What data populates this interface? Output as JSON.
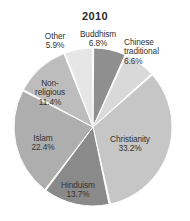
{
  "chart_data": {
    "type": "pie",
    "title": "2010",
    "xlabel": "",
    "ylabel": "",
    "legend_position": "none",
    "grid": false,
    "units": "percent",
    "categories": [
      "Buddhism",
      "Chinese traditional",
      "Christianity",
      "Hinduism",
      "Islam",
      "Non-religious",
      "Other"
    ],
    "values": [
      6.8,
      6.6,
      33.2,
      13.7,
      22.4,
      11.4,
      5.9
    ],
    "slices": [
      {
        "name": "Buddhism",
        "label": "Buddhism",
        "value": 6.8,
        "value_text": "6.8%",
        "color": "#8f8f8f",
        "start_angle": 0,
        "end_angle": 24.48
      },
      {
        "name": "Chinese traditional",
        "label": "Chinese\ntraditional",
        "value": 6.6,
        "value_text": "6.6%",
        "color": "#d9d9d9",
        "start_angle": 24.48,
        "end_angle": 48.24
      },
      {
        "name": "Christianity",
        "label": "Christianity",
        "value": 33.2,
        "value_text": "33.2%",
        "color": "#c6c6c6",
        "start_angle": 48.24,
        "end_angle": 167.76
      },
      {
        "name": "Hinduism",
        "label": "Hinduism",
        "value": 13.7,
        "value_text": "13.7%",
        "color": "#8a8a8a",
        "start_angle": 167.76,
        "end_angle": 217.08
      },
      {
        "name": "Islam",
        "label": "Islam",
        "value": 22.4,
        "value_text": "22.4%",
        "color": "#aeaeae",
        "start_angle": 217.08,
        "end_angle": 297.72
      },
      {
        "name": "Non-religious",
        "label": "Non-\nreligious",
        "value": 11.4,
        "value_text": "11.4%",
        "color": "#bdbdbd",
        "start_angle": 297.72,
        "end_angle": 338.76
      },
      {
        "name": "Other",
        "label": "Other",
        "value": 5.9,
        "value_text": "5.9%",
        "color": "#e6e6e6",
        "start_angle": 338.76,
        "end_angle": 360
      }
    ]
  },
  "labels": {
    "other": "Other\n5.9%",
    "buddhism": "Buddhism\n6.8%",
    "chinese_traditional": "Chinese\ntraditional\n6.6%",
    "non_religious": "Non-\nreligious\n11.4%",
    "islam": "Islam\n22.4%",
    "hinduism": "Hinduism\n13.7%",
    "christianity": "Christianity\n33.2%"
  },
  "colors": {
    "background": "#ffffff",
    "text": "#333333",
    "title_text": "#2b2b2b",
    "slice_separator": "#ffffff"
  }
}
